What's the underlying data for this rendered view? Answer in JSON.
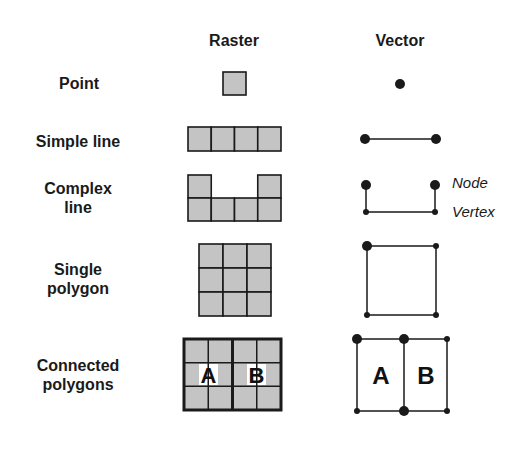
{
  "headers": {
    "raster": "Raster",
    "vector": "Vector"
  },
  "rows": [
    {
      "id": "point",
      "label_lines": [
        "Point"
      ]
    },
    {
      "id": "simple-line",
      "label_lines": [
        "Simple line"
      ]
    },
    {
      "id": "complex-line",
      "label_lines": [
        "Complex",
        "line"
      ]
    },
    {
      "id": "single-polygon",
      "label_lines": [
        "Single",
        "polygon"
      ]
    },
    {
      "id": "connected-polygons",
      "label_lines": [
        "Connected",
        "polygons"
      ]
    }
  ],
  "annotations": {
    "node": "Node",
    "vertex": "Vertex"
  },
  "polygon_labels": {
    "a": "A",
    "b": "B"
  },
  "colors": {
    "cell_fill": "#c4c4c4",
    "stroke": "#1a1a1a",
    "background": "#ffffff"
  }
}
